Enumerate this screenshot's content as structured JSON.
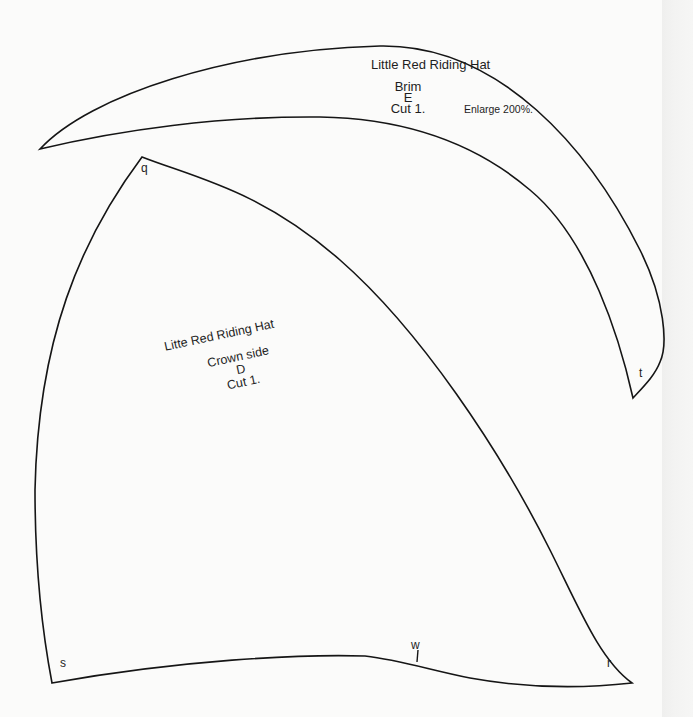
{
  "pieces": {
    "brim": {
      "title": "Little Red Riding Hat",
      "name": "Brim",
      "letter": "E",
      "cut": "Cut 1.",
      "note": "Enlarge 200%.",
      "point_label": "t"
    },
    "crown_side": {
      "title": "Litte Red Riding Hat",
      "name": "Crown side",
      "letter": "D",
      "cut": "Cut 1.",
      "point_labels": {
        "top": "q",
        "bottom_left": "s",
        "bottom_notch": "w",
        "bottom_right": "r"
      }
    }
  },
  "colors": {
    "background": "#fbfbfa",
    "outline": "#151515",
    "text": "#1e1e1e"
  }
}
